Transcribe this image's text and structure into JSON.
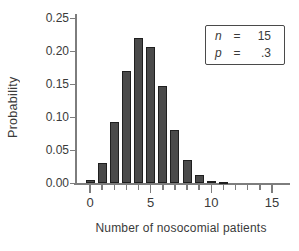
{
  "figure": {
    "background": "#ffffff"
  },
  "chart_data": {
    "type": "bar",
    "title": "",
    "xlabel": "Number of nosocomial patients",
    "ylabel": "Probability",
    "x": [
      0,
      1,
      2,
      3,
      4,
      5,
      6,
      7,
      8,
      9,
      10,
      11,
      12,
      13,
      14,
      15
    ],
    "values": [
      0.005,
      0.031,
      0.092,
      0.17,
      0.219,
      0.206,
      0.147,
      0.081,
      0.035,
      0.012,
      0.003,
      0.002,
      0,
      0,
      0,
      0
    ],
    "ylim": [
      0,
      0.25
    ],
    "y_tick_labels": [
      "0.00",
      "0.05",
      "0.10",
      "0.15",
      "0.20",
      "0.25"
    ],
    "x_tick_values": [
      0,
      1,
      2,
      3,
      4,
      5,
      6,
      7,
      8,
      9,
      10,
      11,
      12,
      13,
      14,
      15
    ],
    "x_major_ticks": [
      {
        "value": 0,
        "label": "0"
      },
      {
        "value": 5,
        "label": "5"
      },
      {
        "value": 10,
        "label": "10"
      },
      {
        "value": 15,
        "label": "15"
      }
    ],
    "grid": "off",
    "legend": {
      "position": "top-right",
      "rows": [
        {
          "var": "n",
          "eq": "=",
          "value": "15"
        },
        {
          "var": "p",
          "eq": "=",
          "value": ".3"
        }
      ]
    },
    "bar_color": "#4a4a4a",
    "bar_border_color": "#1f1f1f",
    "axis_color": "#7d7d7d",
    "text_color": "#3a3a3a"
  }
}
